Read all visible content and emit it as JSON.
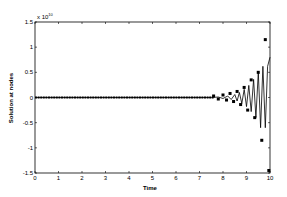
{
  "chart_data": {
    "type": "line",
    "title": "",
    "xlabel": "Time",
    "ylabel": "Solution at nodes",
    "y_exponent_label": "x 10",
    "y_exponent_power": "10",
    "xlim": [
      0,
      10
    ],
    "ylim": [
      -1.5,
      1.5
    ],
    "y_scale_factor": 10000000000.0,
    "grid": false,
    "legend": null,
    "x_ticks": [
      "0",
      "1",
      "2",
      "3",
      "4",
      "5",
      "6",
      "7",
      "8",
      "9",
      "10"
    ],
    "y_ticks": [
      "1.5",
      "1",
      "0.5",
      "0",
      "-0.5",
      "-1",
      "-1.5"
    ],
    "series": [
      {
        "name": "line",
        "style": "solid-line",
        "x": [
          0,
          7.0,
          7.5,
          7.8,
          8.0,
          8.2,
          8.35,
          8.5,
          8.6,
          8.7,
          8.8,
          8.9,
          9.0,
          9.1,
          9.2,
          9.3,
          9.4,
          9.5,
          9.6,
          9.7,
          9.8,
          9.9,
          10.0
        ],
        "values": [
          0,
          0,
          0.0,
          0.01,
          -0.02,
          0.03,
          -0.04,
          0.06,
          -0.07,
          0.1,
          -0.12,
          0.16,
          -0.18,
          0.24,
          -0.28,
          0.36,
          -0.4,
          0.5,
          -0.6,
          0.62,
          -0.6,
          0.62,
          0.8
        ]
      },
      {
        "name": "markers",
        "style": "square-markers",
        "x": [
          7.6,
          7.8,
          8.0,
          8.15,
          8.3,
          8.45,
          8.6,
          8.75,
          8.9,
          9.05,
          9.2,
          9.35,
          9.5,
          9.65,
          9.8,
          9.95
        ],
        "values": [
          0.03,
          -0.03,
          0.05,
          -0.05,
          0.08,
          -0.08,
          0.12,
          -0.14,
          0.2,
          -0.25,
          0.35,
          -0.4,
          0.5,
          -0.85,
          1.15,
          -1.45
        ]
      }
    ]
  }
}
